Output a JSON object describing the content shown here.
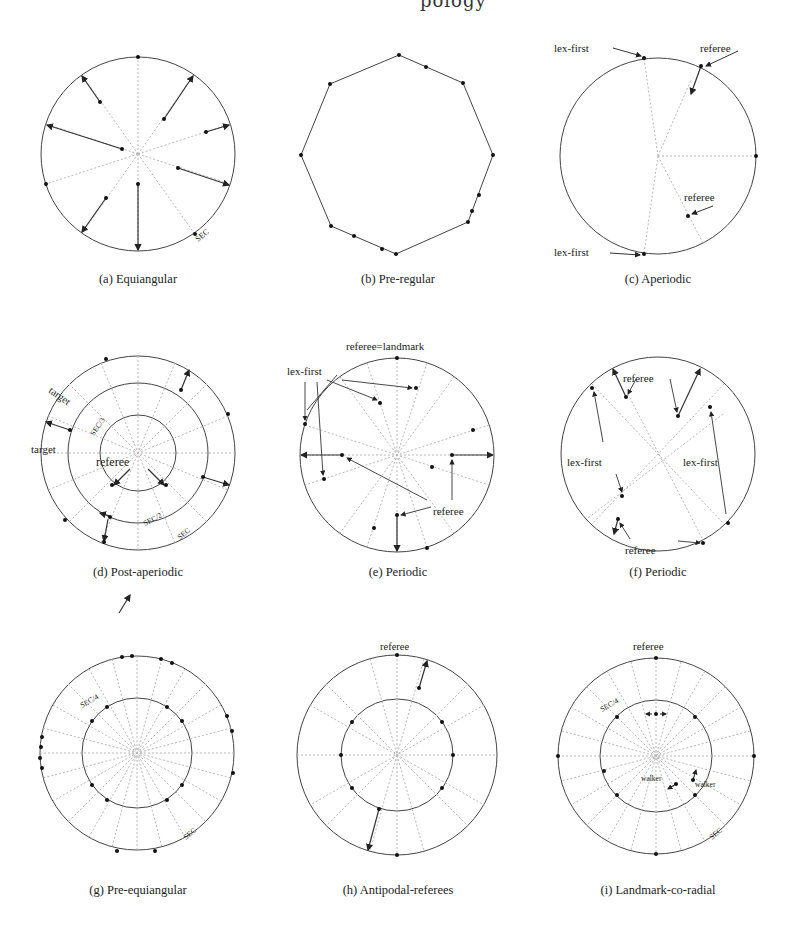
{
  "page": {
    "header_fragment": "pology"
  },
  "figure": {
    "panels": [
      {
        "id": "a",
        "caption": "(a) Equiangular",
        "labels": {
          "sec": "SEC"
        }
      },
      {
        "id": "b",
        "caption": "(b) Pre-regular",
        "labels": {}
      },
      {
        "id": "c",
        "caption": "(c) Aperiodic",
        "labels": {
          "lex_first_top": "lex-first",
          "referee_top": "referee",
          "referee_inner": "referee",
          "lex_first_bottom": "lex-first"
        }
      },
      {
        "id": "d",
        "caption": "(d) Post-aperiodic",
        "labels": {
          "target_1": "target",
          "target_2": "target",
          "sec3": "SEC/3",
          "referee": "referee",
          "sec2": "SEC/2",
          "sec": "SEC"
        }
      },
      {
        "id": "e",
        "caption": "(e) Periodic",
        "labels": {
          "referee_landmark": "referee=landmark",
          "lex_first": "lex-first",
          "referee": "referee"
        }
      },
      {
        "id": "f",
        "caption": "(f) Periodic",
        "labels": {
          "referee_top": "referee",
          "lex_first_left": "lex-first",
          "lex_first_right": "lex-first",
          "referee_bottom": "referee"
        }
      },
      {
        "id": "g",
        "caption": "(g) Pre-equiangular",
        "labels": {
          "sec4": "SEC/4",
          "sec": "SEC"
        }
      },
      {
        "id": "h",
        "caption": "(h) Antipodal-referees",
        "labels": {
          "referee": "referee"
        }
      },
      {
        "id": "i",
        "caption": "(i) Landmark-co-radial",
        "labels": {
          "referee": "referee",
          "sec4": "SEC/4",
          "walker_1": "walker",
          "walker_2": "walker",
          "sec": "SEC"
        }
      }
    ]
  },
  "colors": {
    "stroke": "#444444",
    "dashed": "#b0b0b0",
    "dot": "#111111"
  }
}
